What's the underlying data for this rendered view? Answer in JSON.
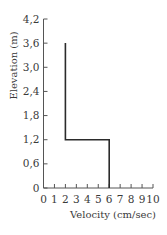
{
  "chart_data": {
    "type": "line",
    "title": "",
    "xlabel": "Velocity (cm/sec)",
    "ylabel": "Elevation (m)",
    "xlim": [
      0,
      10
    ],
    "ylim": [
      0,
      4.2
    ],
    "x_ticks": [
      0,
      1,
      2,
      3,
      4,
      5,
      6,
      7,
      8,
      9,
      10
    ],
    "x_tick_labels": [
      "0",
      "1",
      "2",
      "3",
      "4",
      "5",
      "6",
      "7",
      "8",
      "9",
      "10"
    ],
    "y_ticks": [
      0,
      0.6,
      1.2,
      1.8,
      2.4,
      3.0,
      3.6,
      4.2
    ],
    "y_tick_labels": [
      "0",
      "0,6",
      "1,2",
      "1,8",
      "2,4",
      "3,0",
      "3,6",
      "4,2"
    ],
    "grid": false,
    "legend": null,
    "series": [
      {
        "name": "velocity profile",
        "color": "#2b2b2b",
        "points": [
          {
            "x": 2,
            "y": 3.6
          },
          {
            "x": 2,
            "y": 1.2
          },
          {
            "x": 6,
            "y": 1.2
          },
          {
            "x": 6,
            "y": 0
          }
        ]
      }
    ]
  },
  "colors": {
    "axis": "#555555",
    "line": "#2b2b2b",
    "text": "#3a3a3a",
    "background": "#ffffff"
  }
}
